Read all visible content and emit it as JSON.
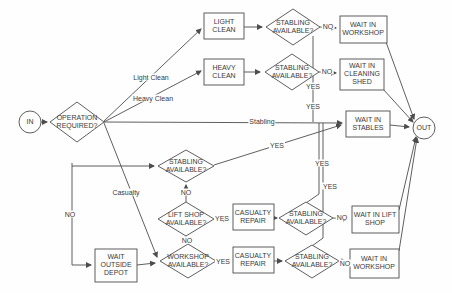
{
  "diagram": {
    "background": "#fefefe",
    "line_color": "#4d4d4d",
    "text_color": "#3a3a3a"
  },
  "nodes": {
    "in": {
      "label": "IN",
      "type": "terminator"
    },
    "out": {
      "label": "OUT",
      "type": "terminator"
    },
    "operation_required": {
      "label": "OPERATION REQUIRED?",
      "type": "decision"
    },
    "light_clean": {
      "label": "LIGHT CLEAN",
      "type": "process"
    },
    "heavy_clean": {
      "label": "HEAVY CLEAN",
      "type": "process"
    },
    "stabling_available_light": {
      "label": "STABLING AVAILABLE?",
      "type": "decision"
    },
    "stabling_available_heavy": {
      "label": "STABLING AVAILABLE?",
      "type": "decision"
    },
    "wait_in_workshop_top": {
      "label": "WAIT IN WORKSHOP",
      "type": "process"
    },
    "wait_in_cleaning_shed": {
      "label": "WAIT IN CLEANING SHED",
      "type": "process"
    },
    "wait_in_stables": {
      "label": "WAIT IN STABLES",
      "type": "process"
    },
    "stabling_available_mid": {
      "label": "STABLING AVAILABLE?",
      "type": "decision"
    },
    "lift_shop_available": {
      "label": "LIFT SHOP AVAILABLE?",
      "type": "decision"
    },
    "workshop_available": {
      "label": "WORKSHOP AVAILABLE?",
      "type": "decision"
    },
    "casualty_repair_lift": {
      "label": "CASUALTY REPAIR",
      "type": "process"
    },
    "casualty_repair_workshop": {
      "label": "CASUALTY REPAIR",
      "type": "process"
    },
    "stabling_available_lift": {
      "label": "STABLING AVAILABLE?",
      "type": "decision"
    },
    "stabling_available_workshop": {
      "label": "STABLING AVAILABLE?",
      "type": "decision"
    },
    "wait_in_lift_shop": {
      "label": "WAIT IN LIFT SHOP",
      "type": "process"
    },
    "wait_in_workshop_bottom": {
      "label": "WAIT IN WORKSHOP",
      "type": "process"
    },
    "wait_outside_depot": {
      "label": "WAIT OUTSIDE DEPOT",
      "type": "process"
    }
  },
  "edge_labels": {
    "light_clean": "Light Clean",
    "heavy_clean": "Heavy Clean",
    "stabling": "Stabling",
    "casualty": "Casualty",
    "no_operation": "NO",
    "no_stabling_light": "NO",
    "no_stabling_heavy": "NO",
    "yes_stabling_light": "YES",
    "yes_stabling_heavy": "YES",
    "yes_stabling_mid": "YES",
    "no_stabling_mid": "NO",
    "no_lift_shop": "NO",
    "yes_lift_shop": "YES",
    "yes_workshop": "YES",
    "no_stabling_lift": "NO",
    "no_stabling_workshop": "NO",
    "yes_stabling_lift": "YES",
    "yes_stabling_workshop": "YES"
  }
}
